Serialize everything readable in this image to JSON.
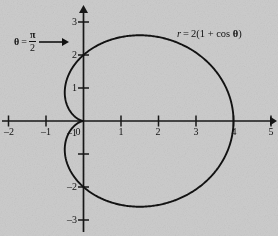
{
  "figure": {
    "background_color": "#cdcdcd",
    "ink_color": "#121212"
  },
  "annotations": {
    "theta_line": {
      "theta_symbol": "θ",
      "equals": "=",
      "numerator": "π",
      "denominator": "2",
      "arrow": "arrow-right"
    },
    "equation": {
      "lhs": "r",
      "equals": "=",
      "rhs_prefix": "2(1 + ",
      "function": "cos",
      "variable": "θ",
      "rhs_suffix": ")",
      "full": "r = 2(1 + cos θ)"
    }
  },
  "chart_data": {
    "type": "line",
    "title": "",
    "subtitle": "",
    "xlabel": "",
    "ylabel": "",
    "curve_label": "r = 2(1 + cos θ)",
    "equation": "r = 2(1 + cos(theta))",
    "coordinate_system": "polar curve plotted on cartesian axes",
    "grid": false,
    "legend": "none",
    "xlim": [
      -2.25,
      5.25
    ],
    "ylim": [
      -3.3,
      3.3
    ],
    "xticks": [
      -2,
      -1,
      0,
      1,
      2,
      3,
      4,
      5
    ],
    "yticks": [
      -3,
      -2,
      -1,
      0,
      1,
      2,
      3
    ],
    "xtick_labels": [
      "–2",
      "–1",
      "0",
      "1",
      "2",
      "3",
      "4",
      "5"
    ],
    "ytick_labels": [
      "–3",
      "–2",
      "–1",
      "0",
      "1",
      "2",
      "3"
    ],
    "theta_range_deg": [
      0,
      360
    ],
    "key_points": [
      {
        "theta_deg": 0,
        "r": 4,
        "x": 4,
        "y": 0,
        "note": "rightmost point"
      },
      {
        "theta_deg": 90,
        "r": 2,
        "x": 0,
        "y": 2,
        "note": "theta = pi/2 crossing"
      },
      {
        "theta_deg": 180,
        "r": 0,
        "x": 0,
        "y": 0,
        "note": "cusp at origin"
      },
      {
        "theta_deg": 270,
        "r": 2,
        "x": 0,
        "y": -2,
        "note": "lower axis crossing"
      },
      {
        "theta_deg": 60,
        "r": 3,
        "x": 1.5,
        "y": 2.6,
        "note": "top of curve"
      },
      {
        "theta_deg": 300,
        "r": 3,
        "x": 1.5,
        "y": -2.6,
        "note": "bottom of curve"
      }
    ]
  }
}
